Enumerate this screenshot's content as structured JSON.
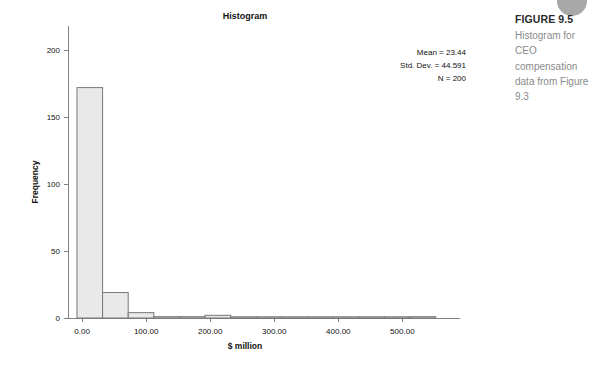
{
  "figure": {
    "number_label": "FIGURE 9.5",
    "caption": "Histogram for CEO compensation data from Figure 9.3"
  },
  "decoration": {
    "corner_circle_color": "#a8a8a8"
  },
  "statistics": {
    "mean_line": "Mean = 23.44",
    "std_dev_line": "Std. Dev. = 44.591",
    "n_line": "N = 200",
    "mean": 23.44,
    "std_dev": 44.591,
    "n": 200
  },
  "chart_data": {
    "type": "bar",
    "title": "Histogram",
    "subtitle": "",
    "xlabel": "$ million",
    "ylabel": "Frequency",
    "xlim": [
      -22,
      590
    ],
    "ylim": [
      0,
      215
    ],
    "grid": false,
    "legend": null,
    "bin_width": 40,
    "xticks": [
      0,
      100,
      200,
      300,
      400,
      500
    ],
    "xtick_labels": [
      "0.00",
      "100.00",
      "200.00",
      "300.00",
      "400.00",
      "500.00"
    ],
    "yticks": [
      0,
      50,
      100,
      150,
      200
    ],
    "ytick_labels": [
      "0",
      "50",
      "100",
      "150",
      "200"
    ],
    "bar_fill": "#e9e9e9",
    "bar_stroke": "#777777",
    "bins": [
      {
        "start": -8,
        "end": 32,
        "value": 172
      },
      {
        "start": 32,
        "end": 72,
        "value": 19
      },
      {
        "start": 72,
        "end": 112,
        "value": 4
      },
      {
        "start": 112,
        "end": 152,
        "value": 1
      },
      {
        "start": 152,
        "end": 192,
        "value": 1
      },
      {
        "start": 192,
        "end": 232,
        "value": 2
      },
      {
        "start": 232,
        "end": 272,
        "value": 0
      },
      {
        "start": 272,
        "end": 312,
        "value": 0
      },
      {
        "start": 312,
        "end": 352,
        "value": 0
      },
      {
        "start": 352,
        "end": 392,
        "value": 0
      },
      {
        "start": 392,
        "end": 432,
        "value": 0
      },
      {
        "start": 432,
        "end": 472,
        "value": 0
      },
      {
        "start": 472,
        "end": 512,
        "value": 0
      },
      {
        "start": 512,
        "end": 552,
        "value": 1
      }
    ],
    "categories": [
      "-8–32",
      "32–72",
      "72–112",
      "112–152",
      "152–192",
      "192–232",
      "232–272",
      "272–312",
      "312–352",
      "352–392",
      "392–432",
      "432–472",
      "472–512",
      "512–552"
    ],
    "values": [
      172,
      19,
      4,
      1,
      1,
      2,
      0,
      0,
      0,
      0,
      0,
      0,
      0,
      1
    ]
  }
}
